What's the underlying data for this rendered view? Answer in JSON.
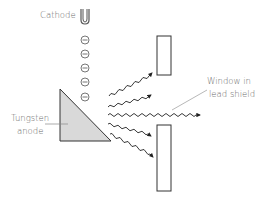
{
  "diagram": {
    "labels": {
      "cathode": "Cathode",
      "anode_line1": "Tungsten",
      "anode_line2": "anode",
      "window_line1": "Window in",
      "window_line2": "lead shield"
    },
    "electron_symbol": "−",
    "electron_count": 5,
    "xray_count": 5,
    "colors": {
      "stroke": "#333333",
      "anode_fill": "#d9d9d9",
      "label_text": "#6b6b6b",
      "leader_line": "#9a9a9a"
    }
  }
}
